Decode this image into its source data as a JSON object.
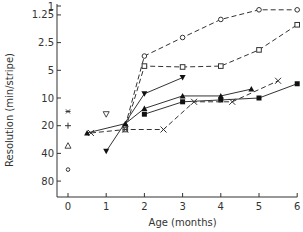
{
  "chart_data": {
    "type": "line",
    "title": "",
    "xlabel": "Age (months)",
    "ylabel": "Resolution (min/stripe)",
    "x_ticks": [
      0,
      1,
      2,
      3,
      4,
      5,
      6
    ],
    "y_ticks": [
      1,
      1.25,
      2.5,
      5,
      10,
      20,
      40,
      80
    ],
    "y_tick_labels": [
      "1",
      "1.25",
      "2.5",
      "5",
      "10",
      "20",
      "40",
      "80"
    ],
    "y_scale": "log",
    "y_inverted": true,
    "xlim": [
      0,
      6
    ],
    "ylim": [
      1,
      130
    ],
    "grid": false,
    "legend": null,
    "series": [
      {
        "name": "open-circle",
        "marker": "circle-open",
        "line": "dashed",
        "points": [
          [
            1.5,
            20
          ],
          [
            2,
            3.5
          ],
          [
            3,
            2.2
          ],
          [
            4,
            1.4
          ],
          [
            5,
            1.1
          ],
          [
            6,
            1.1
          ]
        ]
      },
      {
        "name": "open-square",
        "marker": "square-open",
        "line": "dashed",
        "points": [
          [
            1.5,
            22
          ],
          [
            2,
            4.5
          ],
          [
            3,
            4.6
          ],
          [
            4,
            4.5
          ],
          [
            5,
            3.0
          ],
          [
            6,
            1.6
          ]
        ]
      },
      {
        "name": "filled-down-triangle",
        "marker": "triangle-down-filled",
        "line": "solid",
        "points": [
          [
            1,
            38
          ],
          [
            2,
            9
          ],
          [
            3,
            6
          ]
        ]
      },
      {
        "name": "filled-triangle",
        "marker": "triangle-up-filled",
        "line": "solid",
        "points": [
          [
            0.5,
            24
          ],
          [
            1.5,
            19
          ],
          [
            2,
            13
          ],
          [
            3,
            9.5
          ],
          [
            4,
            9.5
          ],
          [
            4.8,
            8
          ]
        ]
      },
      {
        "name": "filled-square",
        "marker": "square-filled",
        "line": "solid",
        "points": [
          [
            2,
            15
          ],
          [
            3,
            11
          ],
          [
            4,
            10.5
          ],
          [
            5,
            10
          ],
          [
            6,
            7
          ]
        ]
      },
      {
        "name": "cross",
        "marker": "x",
        "line": "dashed",
        "points": [
          [
            0.6,
            24
          ],
          [
            1.5,
            22
          ],
          [
            2.5,
            22
          ],
          [
            3.3,
            11
          ],
          [
            4.3,
            11
          ],
          [
            5.5,
            6.5
          ]
        ]
      }
    ],
    "age0_points": [
      {
        "marker": "asterisk",
        "value": 14
      },
      {
        "marker": "plus",
        "value": 20
      },
      {
        "marker": "triangle-open",
        "value": 33
      },
      {
        "marker": "circle-open-small",
        "value": 60
      }
    ],
    "extra_points": [
      {
        "marker": "triangle-down-open",
        "age": 1,
        "value": 15
      }
    ]
  }
}
